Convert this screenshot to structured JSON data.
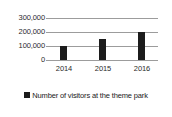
{
  "chart_data": {
    "type": "bar",
    "title": "",
    "subtitle": "",
    "xlabel": "",
    "ylabel": "",
    "categories": [
      "2014",
      "2015",
      "2016"
    ],
    "series": [
      {
        "name": "Number of visitors at the theme park",
        "values": [
          100000,
          150000,
          200000
        ],
        "color": "#1c1c1c"
      }
    ],
    "ylim": [
      0,
      300000
    ],
    "y_ticks": [
      0,
      100000,
      200000,
      300000
    ],
    "y_tick_labels": [
      "0",
      "100,000",
      "200,000",
      "300,000"
    ],
    "grid": true,
    "grid_color": "#9c9c9c",
    "legend_position": "bottom-center",
    "background": "#ffffff"
  },
  "legend": {
    "items": [
      {
        "label": "Number of visitors at the theme park",
        "swatch_color": "#1c1c1c",
        "swatch_icon": "legend-square-icon"
      }
    ]
  },
  "axes": {
    "y": {
      "tick_labels": [
        "300,000",
        "200,000",
        "100,000",
        "0"
      ]
    },
    "x": {
      "tick_labels": [
        "2014",
        "2015",
        "2016"
      ]
    }
  }
}
